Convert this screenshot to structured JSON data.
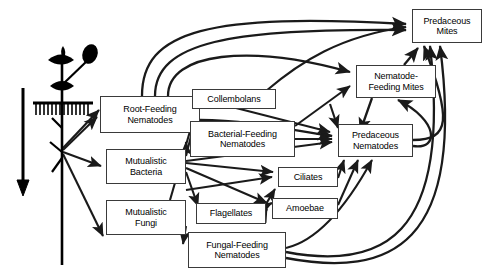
{
  "diagram": {
    "type": "directed-graph",
    "width": 488,
    "height": 279,
    "background": "#ffffff",
    "line_color": "#1a1a1a",
    "box_border_color": "#3a3a3a",
    "box_fill": "#ffffff"
  },
  "plant": {
    "name": "plant-with-roots",
    "soil_line_label": "",
    "energy_arrow_label": ""
  },
  "nodes": [
    {
      "id": "root_feeding",
      "label": "Root-Feeding\nNematodes",
      "line1": "Root-Feeding",
      "line2": "Nematodes",
      "x": 100,
      "y": 96,
      "w": 100,
      "h": 37
    },
    {
      "id": "collembolans",
      "label": "Collembolans",
      "line1": "Collembolans",
      "line2": "",
      "x": 192,
      "y": 89,
      "w": 84,
      "h": 20
    },
    {
      "id": "bacterial_feeding",
      "label": "Bacterial-Feeding\nNematodes",
      "line1": "Bacterial-Feeding",
      "line2": "Nematodes",
      "x": 190,
      "y": 121,
      "w": 105,
      "h": 36
    },
    {
      "id": "mutualistic_bacteria",
      "label": "Mutualistic\nBacteria",
      "line1": "Mutualistic",
      "line2": "Bacteria",
      "x": 106,
      "y": 149,
      "w": 80,
      "h": 35
    },
    {
      "id": "mutualistic_fungi",
      "label": "Mutualistic\nFungi",
      "line1": "Mutualistic",
      "line2": "Fungi",
      "x": 106,
      "y": 200,
      "w": 80,
      "h": 35
    },
    {
      "id": "ciliates",
      "label": "Ciliates",
      "line1": "Ciliates",
      "line2": "",
      "x": 278,
      "y": 167,
      "w": 60,
      "h": 20
    },
    {
      "id": "flagellates",
      "label": "Flagellates",
      "line1": "Flagellates",
      "line2": "",
      "x": 196,
      "y": 203,
      "w": 70,
      "h": 21
    },
    {
      "id": "amoebae",
      "label": "Amoebae",
      "line1": "Amoebae",
      "line2": "",
      "x": 272,
      "y": 198,
      "w": 66,
      "h": 21
    },
    {
      "id": "fungal_feeding",
      "label": "Fungal-Feeding\nNematodes",
      "line1": "Fungal-Feeding",
      "line2": "Nematodes",
      "x": 188,
      "y": 232,
      "w": 98,
      "h": 36
    },
    {
      "id": "predaceous_nematodes",
      "label": "Predaceous\nNematodes",
      "line1": "Predaceous",
      "line2": "Nematodes",
      "x": 338,
      "y": 124,
      "w": 75,
      "h": 33
    },
    {
      "id": "nematode_feeding_mites",
      "label": "Nematode-\nFeeding Mites",
      "line1": "Nematode-",
      "line2": "Feeding Mites",
      "x": 356,
      "y": 65,
      "w": 80,
      "h": 33
    },
    {
      "id": "predaceous_mites",
      "label": "Predaceous\nMites",
      "line1": "Predaceous",
      "line2": "Mites",
      "x": 412,
      "y": 9,
      "w": 70,
      "h": 34
    }
  ],
  "edges": [
    {
      "from": "plant_root",
      "to": "root_feeding"
    },
    {
      "from": "plant_root",
      "to": "mutualistic_bacteria"
    },
    {
      "from": "plant_root",
      "to": "mutualistic_fungi"
    },
    {
      "from": "root_feeding",
      "to": "predaceous_mites"
    },
    {
      "from": "root_feeding",
      "to": "predaceous_mites"
    },
    {
      "from": "root_feeding",
      "to": "nematode_feeding_mites"
    },
    {
      "from": "root_feeding",
      "to": "predaceous_nematodes"
    },
    {
      "from": "mutualistic_bacteria",
      "to": "collembolans"
    },
    {
      "from": "mutualistic_bacteria",
      "to": "bacterial_feeding"
    },
    {
      "from": "mutualistic_bacteria",
      "to": "ciliates"
    },
    {
      "from": "mutualistic_bacteria",
      "to": "amoebae"
    },
    {
      "from": "mutualistic_bacteria",
      "to": "flagellates"
    },
    {
      "from": "mutualistic_bacteria",
      "to": "predaceous_nematodes"
    },
    {
      "from": "mutualistic_fungi",
      "to": "collembolans"
    },
    {
      "from": "mutualistic_fungi",
      "to": "fungal_feeding"
    },
    {
      "from": "bacterial_feeding",
      "to": "predaceous_nematodes"
    },
    {
      "from": "bacterial_feeding",
      "to": "nematode_feeding_mites"
    },
    {
      "from": "collembolans",
      "to": "predaceous_mites"
    },
    {
      "from": "flagellates",
      "to": "amoebae"
    },
    {
      "from": "flagellates",
      "to": "predaceous_nematodes"
    },
    {
      "from": "ciliates",
      "to": "predaceous_nematodes"
    },
    {
      "from": "amoebae",
      "to": "predaceous_nematodes"
    },
    {
      "from": "fungal_feeding",
      "to": "predaceous_nematodes"
    },
    {
      "from": "fungal_feeding",
      "to": "nematode_feeding_mites"
    },
    {
      "from": "fungal_feeding",
      "to": "predaceous_mites"
    },
    {
      "from": "predaceous_nematodes",
      "to": "predaceous_mites"
    },
    {
      "from": "predaceous_nematodes",
      "to": "nematode_feeding_mites"
    },
    {
      "from": "nematode_feeding_mites",
      "to": "predaceous_mites"
    }
  ]
}
